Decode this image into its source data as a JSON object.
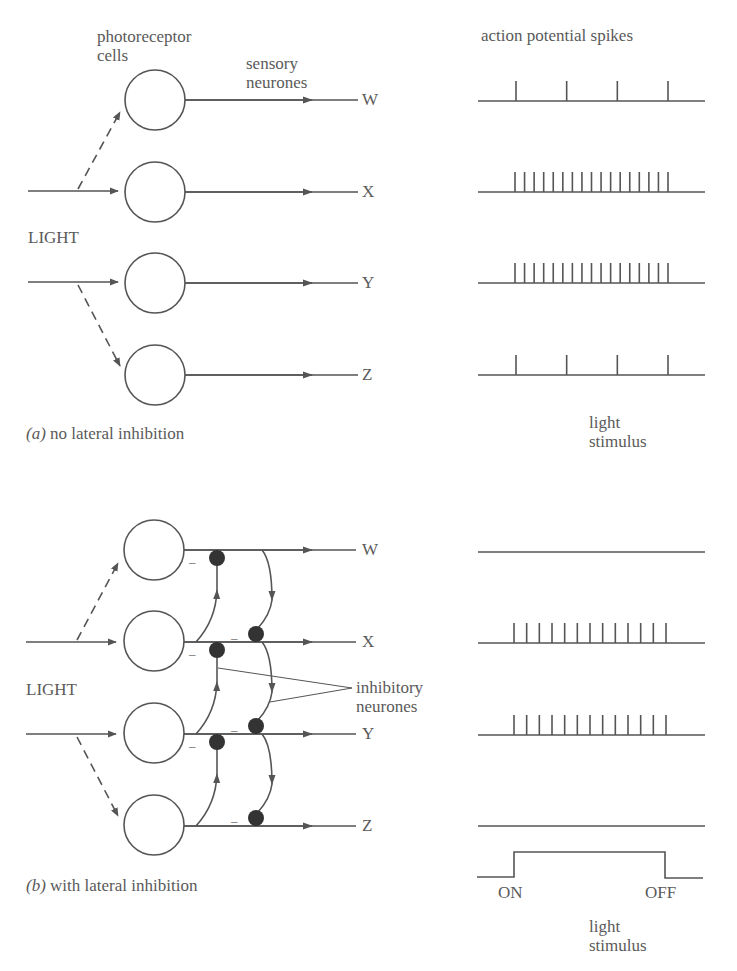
{
  "panel_a": {
    "caption_prefix": "(a)",
    "caption_text": "no lateral inhibition",
    "labels": {
      "photoreceptor_line1": "photoreceptor",
      "photoreceptor_line2": "cells",
      "sensory_line1": "sensory",
      "sensory_line2": "neurones",
      "light": "LIGHT",
      "spikes_title": "action potential spikes",
      "stimulus_line1": "light",
      "stimulus_line2": "stimulus"
    },
    "outputs": [
      "W",
      "X",
      "Y",
      "Z"
    ],
    "spike_counts": {
      "W": 4,
      "X": 17,
      "Y": 17,
      "Z": 4
    }
  },
  "panel_b": {
    "caption_prefix": "(b)",
    "caption_text": "with lateral inhibition",
    "labels": {
      "light": "LIGHT",
      "inhibitory_line1": "inhibitory",
      "inhibitory_line2": "neurones",
      "minus": "–",
      "on": "ON",
      "off": "OFF",
      "stimulus_line1": "light",
      "stimulus_line2": "stimulus"
    },
    "outputs": [
      "W",
      "X",
      "Y",
      "Z"
    ],
    "spike_counts": {
      "W": 0,
      "X": 13,
      "Y": 13,
      "Z": 0
    }
  },
  "colors": {
    "line": "#555555",
    "synapse": "#333333",
    "text": "#5a5a5a"
  }
}
